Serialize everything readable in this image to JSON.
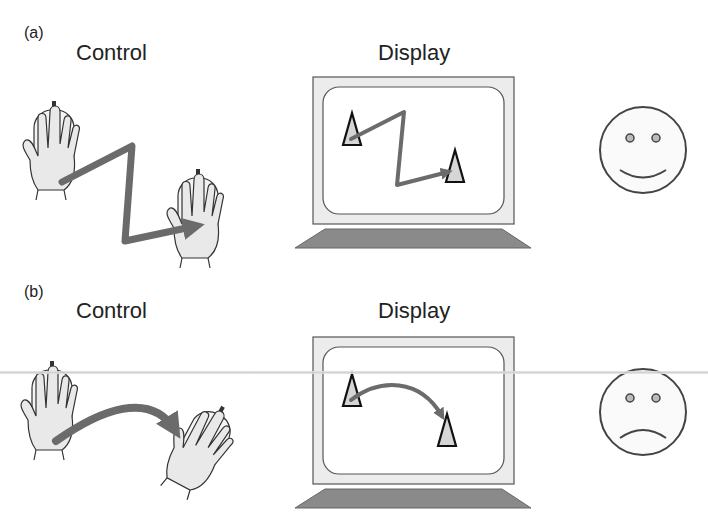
{
  "panel_a": {
    "tag": "(a)",
    "control_label": "Control",
    "display_label": "Display",
    "path_shape": "zigzag",
    "face": "smiley-face"
  },
  "panel_b": {
    "tag": "(b)",
    "control_label": "Control",
    "display_label": "Display",
    "path_shape": "curved arc",
    "face": "frowning-face"
  },
  "colors": {
    "arrow": "#6b6b6b",
    "hand_fill": "#e9e9e9",
    "monitor_bezel": "#ececec",
    "monitor_stand": "#8a8a8a",
    "outline": "#333333"
  }
}
